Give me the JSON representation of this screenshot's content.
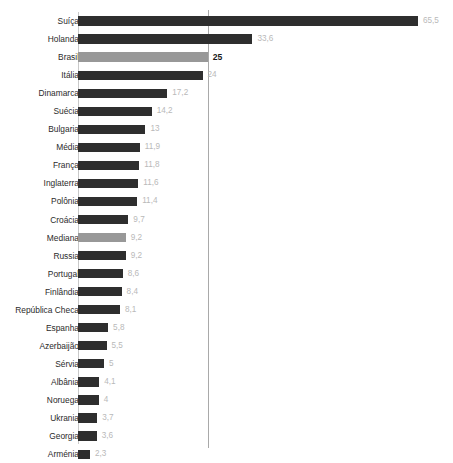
{
  "chart": {
    "title": "",
    "highlight_color": "#989898",
    "bar_color": "#2e2e2e",
    "value_color": "#b9b9b9",
    "label_color": "#2b2b2b",
    "reference_line_color": "#a9a9a9"
  },
  "chart_data": {
    "type": "bar",
    "orientation": "horizontal",
    "title": "",
    "xlabel": "",
    "ylabel": "",
    "xlim": [
      0,
      70
    ],
    "grid": false,
    "legend": false,
    "reference_line": 25,
    "highlighted": [
      "Brasil",
      "Mediana"
    ],
    "categories": [
      "Suíça",
      "Holanda",
      "Brasil",
      "Itália",
      "Dinamarca",
      "Suécia",
      "Bulgaria",
      "Média",
      "França",
      "Inglaterra",
      "Polônia",
      "Croácia",
      "Mediana",
      "Russia",
      "Portugal",
      "Finlândia",
      "República Checa",
      "Espanha",
      "Azerbaijão",
      "Sérvia",
      "Albânia",
      "Noruega",
      "Ukrania",
      "Georgia",
      "Arménia"
    ],
    "values": [
      65.5,
      33.6,
      25,
      24,
      17.2,
      14.2,
      13,
      11.9,
      11.8,
      11.6,
      11.4,
      9.7,
      9.2,
      9.2,
      8.6,
      8.4,
      8.1,
      5.8,
      5.5,
      5,
      4.1,
      4,
      3.7,
      3.6,
      2.3
    ],
    "value_labels": [
      "65,5",
      "33,6",
      "25",
      "24",
      "17,2",
      "14,2",
      "13",
      "11,9",
      "11,8",
      "11,6",
      "11,4",
      "9,7",
      "9,2",
      "9,2",
      "8,6",
      "8,4",
      "8,1",
      "5,8",
      "5,5",
      "5",
      "4,1",
      "4",
      "3,7",
      "3,6",
      "2,3"
    ]
  }
}
